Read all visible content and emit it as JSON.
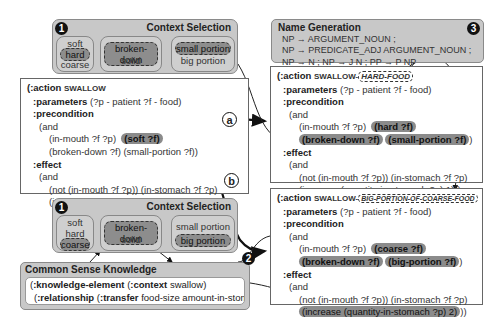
{
  "context_selection_top": {
    "badge": "1",
    "title": "Context Selection",
    "groups": [
      {
        "options": [
          "soft",
          "hard",
          "coarse"
        ],
        "selected": "hard"
      },
      {
        "options": [
          "broken-down",
          "solid"
        ],
        "selected": "broken-down"
      },
      {
        "options": [
          "small portion",
          "big portion"
        ],
        "selected": "small portion"
      }
    ]
  },
  "context_selection_bottom": {
    "badge": "1",
    "title": "Context Selection",
    "groups": [
      {
        "options": [
          "soft",
          "hard",
          "coarse"
        ],
        "selected": "coarse"
      },
      {
        "options": [
          "broken-down",
          "solid"
        ],
        "selected": "broken-down"
      },
      {
        "options": [
          "small portion",
          "big portion"
        ],
        "selected": "big portion"
      }
    ]
  },
  "name_generation": {
    "badge": "3",
    "title": "Name Generation",
    "rules": [
      "NP → ARGUMENT_NOUN ;",
      "NP → PREDICATE_ADJ ARGUMENT_NOUN ;",
      "NP → N  ;  NP → J N  ;  PP → P NP"
    ]
  },
  "common_sense": {
    "badge": "2",
    "title": "Common Sense Knowledge",
    "line1": {
      "kw1": ":knowledge-element",
      "kw2": ":context",
      "val": "swallow)"
    },
    "line2": {
      "kw1": ":relationship",
      "kw2": ":transfer",
      "val": "food-size amount-in-stomach)))"
    }
  },
  "source_action": {
    "head": "(:action",
    "name": "SWALLOW",
    "parameters_kw": ":parameters",
    "parameters": "(?p - patient ?f - food)",
    "precondition_kw": ":precondition",
    "and": "(and",
    "pre1": "(in-mouth ?f ?p)",
    "pre1_hl": "(soft ?f)",
    "pre2": "(broken-down ?f)  (small-portion ?f))",
    "effect_kw": ":effect",
    "eff1": "(not (in-mouth ?f ?p))  (in-stomach ?f ?p)",
    "eff2": "(increase (quantity-in-stomach ?p) 1)))"
  },
  "arrows": {
    "a": "a",
    "b": "b"
  },
  "action_a": {
    "head": "(:action",
    "name": "SWALLOW-",
    "suffix": "HARD-FOOD",
    "parameters_kw": ":parameters",
    "parameters": "(?p - patient ?f - food)",
    "precondition_kw": ":precondition",
    "and": "(and",
    "pre1": "(in-mouth ?f ?p)",
    "pre1_hl": "(hard ?f)",
    "pre2_hl1": "(broken-down ?f)",
    "pre2_hl2": "(small-portion ?f)",
    "pre2_end": ")",
    "effect_kw": ":effect",
    "eff1": "(not (in-mouth ?f ?p)) (in-stomach ?f ?p)",
    "eff2": "(increase (quantity-in-stomach ?p) 1)))"
  },
  "action_b": {
    "head": "(:action",
    "name": "SWALLOW-",
    "suffix": "BIG-PORTION-OF-COARSE-FOOD",
    "parameters_kw": ":parameters",
    "parameters": "(?p - patient ?f - food)",
    "precondition_kw": ":precondition",
    "and": "(and",
    "pre1": "(in-mouth ?f ?p)",
    "pre1_hl": "(coarse ?f)",
    "pre2_hl1": "(broken-down ?f)",
    "pre2_hl2": "(big-portion ?f)",
    "pre2_end": ")",
    "effect_kw": ":effect",
    "eff1": "(not (in-mouth ?f ?p)) (in-stomach ?f ?p)",
    "eff2_hl": "(increase (quantity-in-stomach ?p) 2)",
    "eff2_end": "))"
  }
}
